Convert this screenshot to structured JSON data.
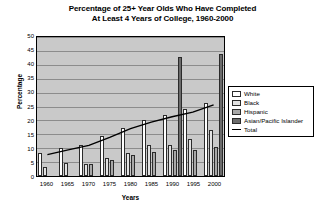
{
  "chart_data": {
    "type": "bar",
    "title": "Percentage of 25+ Year Olds Who Have Completed At Least 4 Years of College, 1960-2000",
    "title_line1": "Percentage of 25+ Year Olds Who Have Completed",
    "title_line2": "At Least 4 Years of College, 1960-2000",
    "xlabel": "Years",
    "ylabel": "Percentage",
    "ylim": [
      0,
      50
    ],
    "yticks": [
      0,
      5,
      10,
      15,
      20,
      25,
      30,
      35,
      40,
      45,
      50
    ],
    "categories": [
      "1960",
      "1965",
      "1970",
      "1975",
      "1980",
      "1985",
      "1990",
      "1995",
      "2000"
    ],
    "grid": true,
    "legend_position": "right",
    "series": [
      {
        "name": "White",
        "color": "#ffffff",
        "kind": "bar",
        "values": [
          8.1,
          9.9,
          11.3,
          14.5,
          17.1,
          20.0,
          22.0,
          24.0,
          26.1
        ]
      },
      {
        "name": "Black",
        "color": "#e2e2e2",
        "kind": "bar",
        "values": [
          3.1,
          4.7,
          4.4,
          6.4,
          8.4,
          11.1,
          11.3,
          13.2,
          16.5
        ]
      },
      {
        "name": "Hispanic",
        "color": "#a8a8a8",
        "kind": "bar",
        "values": [
          null,
          null,
          4.5,
          5.9,
          7.6,
          8.5,
          9.2,
          9.3,
          10.6
        ]
      },
      {
        "name": "Asian/Pacific Islander",
        "color": "#6b6b6b",
        "kind": "bar",
        "values": [
          null,
          null,
          null,
          null,
          null,
          null,
          42.8,
          null,
          44.0
        ]
      },
      {
        "name": "Total",
        "color": "#000000",
        "kind": "line",
        "values": [
          7.7,
          9.4,
          11.0,
          13.9,
          17.0,
          19.4,
          21.3,
          23.0,
          25.6
        ]
      }
    ]
  },
  "legend": {
    "items": [
      {
        "label": "White",
        "swatch": "white"
      },
      {
        "label": "Black",
        "swatch": "black"
      },
      {
        "label": "Hispanic",
        "swatch": "hisp"
      },
      {
        "label": "Asian/Pacific Islander",
        "swatch": "asian"
      },
      {
        "label": "Total",
        "swatch": "line"
      }
    ]
  }
}
